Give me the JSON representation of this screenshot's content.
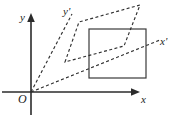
{
  "figure": {
    "type": "geometry-diagram",
    "background_color": "#ffffff",
    "line_color": "#2b2b2b",
    "dashed_color": "#303030",
    "labels": {
      "origin": "O",
      "x_axis": "x",
      "y_axis": "y",
      "x_prime_axis": "x'",
      "y_prime_axis": "y'"
    },
    "axes": {
      "origin_point": [
        31,
        92
      ],
      "x_axis_start": [
        2,
        92
      ],
      "x_axis_end": [
        140,
        92
      ],
      "y_axis_start": [
        31,
        115
      ],
      "y_axis_end": [
        31,
        14
      ],
      "arrowheads": [
        "x-axis-end",
        "y-axis-end"
      ]
    },
    "rectangle": {
      "x": 89,
      "y": 29,
      "width": 57,
      "height": 49,
      "stroke": "#3a3a3a",
      "fill": "none"
    },
    "parallelogram": {
      "dashed": true,
      "vertices": [
        [
          65,
          62
        ],
        [
          79,
          22
        ],
        [
          140,
          5
        ],
        [
          124,
          46
        ]
      ]
    },
    "rays": [
      {
        "name": "y-prime-ray",
        "from": [
          31,
          92
        ],
        "to": [
          72,
          14
        ],
        "dashed": true,
        "label": "y'"
      },
      {
        "name": "x-prime-ray",
        "from": [
          31,
          92
        ],
        "to": [
          160,
          40
        ],
        "dashed": true,
        "label": "x'"
      }
    ]
  }
}
